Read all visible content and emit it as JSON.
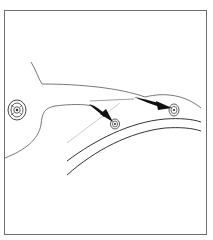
{
  "figure": {
    "type": "technical-illustration",
    "colors": {
      "frame": "#6e6e6e",
      "line": "#3a3a3a",
      "light_line": "#9a9a9a",
      "arrow": "#111111",
      "background": "#ffffff"
    },
    "elements": [
      {
        "id": "grommet",
        "label": ""
      },
      {
        "id": "arrow-1",
        "label": ""
      },
      {
        "id": "arrow-2",
        "label": ""
      },
      {
        "id": "clip-1",
        "label": ""
      },
      {
        "id": "clip-2",
        "label": ""
      }
    ]
  }
}
